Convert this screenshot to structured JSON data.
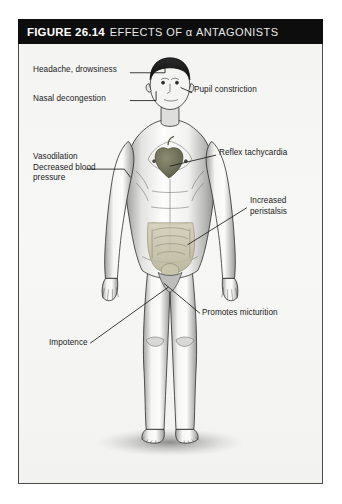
{
  "figure": {
    "title_label": "FIGURE 26.14",
    "title_text": "EFFECTS OF α ANTAGONISTS",
    "alt": "Anatomical male figure showing effects of alpha antagonists"
  },
  "labels": {
    "headache": "Headache, drowsiness",
    "nasal": "Nasal decongestion",
    "vasodilation": "Vasodilation\nDecreased blood\npressure",
    "pupil": "Pupil constriction",
    "reflex": "Reflex tachycardia",
    "peristalsis": "Increased\nperistalsis",
    "micturition": "Promotes micturition",
    "impotence": "Impotence"
  },
  "colors": {
    "title_bar": "#0d0d0d",
    "title_text": "#ffffff",
    "panel_background": "#f4f4f2",
    "panel_border": "#4a4a4a",
    "label_text": "#1b1b1b",
    "leader_line": "#1b1b1b",
    "skin_light": "#fbfbfa",
    "skin_shadow": "#8e8e8e",
    "hair_dark": "#1a1a1a",
    "heart_organ": "#6f7058",
    "intestine_organ": "#b9b49a"
  }
}
